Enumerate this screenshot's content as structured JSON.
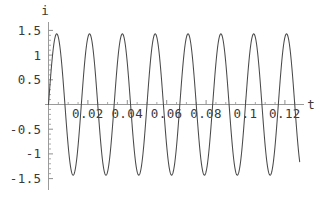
{
  "figure": {
    "background_color": "#ffffff",
    "axis_color": "#9a9a9a",
    "curve_color": "#4a4a4a",
    "text_color": "#3a3a3a",
    "width": 331,
    "height": 197
  },
  "chart_data": {
    "type": "line",
    "title": "",
    "subtitle": "",
    "xlabel": "t",
    "ylabel": "i",
    "grid": false,
    "legend": null,
    "xlim": [
      0,
      0.1335
    ],
    "ylim": [
      -1.55,
      1.55
    ],
    "xticks": [
      0.02,
      0.04,
      0.06,
      0.08,
      0.1,
      0.12
    ],
    "xtick_labels": [
      "0.02",
      "0.04",
      "0.06",
      "0.08",
      "0.1",
      "0.12"
    ],
    "yticks": [
      1.5,
      1,
      0.5,
      -0.5,
      -1,
      -1.5
    ],
    "ytick_labels": [
      "1.5",
      "1",
      "0.5",
      "-0.5",
      "-1",
      "-1.5"
    ],
    "x_minor_tick_step": 0.005,
    "y_minor_tick_step": 0.1,
    "series": [
      {
        "name": "i(t)",
        "color": "#4a4a4a",
        "function": "1.43 * sin(2*pi*60*t)",
        "amplitude": 1.43,
        "frequency_hz": 60,
        "phase": 0,
        "x_start": 0,
        "x_end": 0.1275,
        "cycles": 7.65,
        "peak_value": 1.43,
        "trough_value": -1.43
      }
    ],
    "annotations": []
  },
  "axis_labels": {
    "y_axis_name": "i",
    "x_axis_name": "t"
  }
}
